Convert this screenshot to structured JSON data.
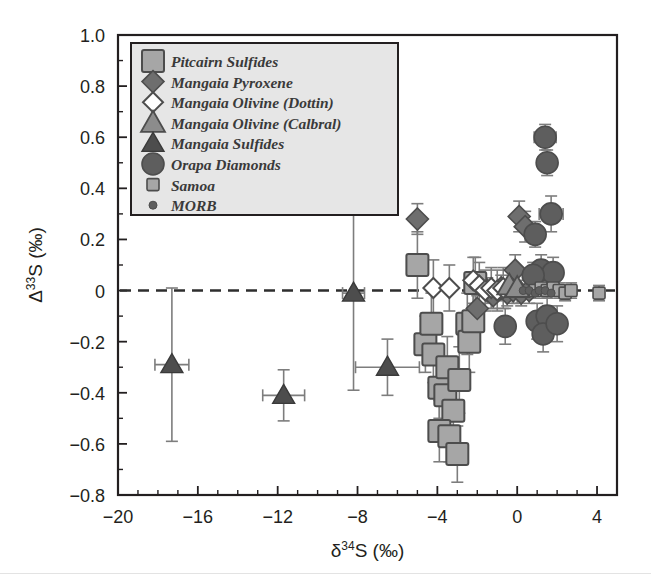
{
  "figure": {
    "background": "#ffffff",
    "axis_color": "#231f20"
  },
  "axes": {
    "x": {
      "label_delta": "δ",
      "label_sup": "34",
      "label_rest": "S (‰)",
      "label_full": "δ34S (‰)",
      "min": -20,
      "max": 5,
      "ticks": [
        -20,
        -16,
        -12,
        -8,
        -4,
        0,
        4
      ],
      "tick_labels": [
        "−20",
        "−16",
        "−12",
        "−8",
        "−4",
        "0",
        "4"
      ],
      "minor_step": 1
    },
    "y": {
      "label_delta": "Δ",
      "label_sup": "33",
      "label_rest": "S (‰)",
      "label_full": "Δ33S (‰)",
      "min": -0.8,
      "max": 1.0,
      "ticks": [
        -0.8,
        -0.6,
        -0.4,
        -0.2,
        0,
        0.2,
        0.4,
        0.6,
        0.8,
        1.0
      ],
      "tick_labels": [
        "−0.8",
        "−0.6",
        "−0.4",
        "−0.2",
        "0",
        "0.2",
        "0.4",
        "0.6",
        "0.8",
        "1.0"
      ],
      "minor_step": 0.1
    },
    "reference_line": {
      "value": 0,
      "style": "dashed"
    }
  },
  "legend": {
    "position": "top-left",
    "background": "#e6e6e6",
    "items": [
      {
        "label": "Pitcairn Sulfides",
        "marker": "square-large",
        "fill": "#a6a6a6",
        "stroke": "#4d4d4d"
      },
      {
        "label": "Mangaia Pyroxene",
        "marker": "diamond-filled",
        "fill": "#6e6e6e",
        "stroke": "#4d4d4d"
      },
      {
        "label": "Mangaia Olivine (Dottin)",
        "marker": "diamond-open",
        "fill": "#ffffff",
        "stroke": "#4d4d4d"
      },
      {
        "label": "Mangaia Olivine (Calbral)",
        "marker": "triangle-gray",
        "fill": "#8c8c8c",
        "stroke": "#4d4d4d"
      },
      {
        "label": "Mangaia Sulfides",
        "marker": "triangle-dark",
        "fill": "#4d4d4d",
        "stroke": "#3a3a3a"
      },
      {
        "label": "Orapa Diamonds",
        "marker": "circle-filled",
        "fill": "#5e5e5e",
        "stroke": "#4d4d4d"
      },
      {
        "label": "Samoa",
        "marker": "square-small",
        "fill": "#a6a6a6",
        "stroke": "#4d4d4d"
      },
      {
        "label": "MORB",
        "marker": "dot-small",
        "fill": "#5e5e5e",
        "stroke": "#4d4d4d"
      }
    ]
  },
  "chart_data": {
    "type": "scatter",
    "title": "",
    "xlabel": "δ34S (‰)",
    "ylabel": "Δ33S (‰)",
    "xlim": [
      -20,
      5
    ],
    "ylim": [
      -0.8,
      1.0
    ],
    "grid": false,
    "legend_position": "top-left",
    "reference_lines": [
      {
        "axis": "y",
        "value": 0,
        "style": "dashed"
      }
    ],
    "series": [
      {
        "name": "Mangaia Sulfides",
        "marker": "triangle-dark",
        "points": [
          {
            "x": -17.3,
            "y": -0.29,
            "xerr": 0.85,
            "yerr": 0.3
          },
          {
            "x": -11.7,
            "y": -0.41,
            "xerr": 1.05,
            "yerr": 0.1
          },
          {
            "x": -8.2,
            "y": -0.01,
            "xerr": 0.55,
            "yerr": 0.38
          },
          {
            "x": -6.5,
            "y": -0.3,
            "xerr": 1.6,
            "yerr": 0.11
          }
        ]
      },
      {
        "name": "Pitcairn Sulfides",
        "marker": "square-large",
        "points": [
          {
            "x": -5.0,
            "y": 0.1,
            "xerr": 0,
            "yerr": 0.13
          },
          {
            "x": -4.6,
            "y": -0.21,
            "xerr": 0,
            "yerr": 0.11
          },
          {
            "x": -4.3,
            "y": -0.13,
            "xerr": 0,
            "yerr": 0.12
          },
          {
            "x": -4.2,
            "y": -0.25,
            "xerr": 0,
            "yerr": 0.11
          },
          {
            "x": -3.9,
            "y": -0.38,
            "xerr": 0,
            "yerr": 0.12
          },
          {
            "x": -3.6,
            "y": -0.41,
            "xerr": 0,
            "yerr": 0.12
          },
          {
            "x": -3.5,
            "y": -0.3,
            "xerr": 0,
            "yerr": 0.12
          },
          {
            "x": -3.2,
            "y": -0.47,
            "xerr": 0,
            "yerr": 0.11
          },
          {
            "x": -2.9,
            "y": -0.35,
            "xerr": 0,
            "yerr": 0.13
          },
          {
            "x": -3.9,
            "y": -0.55,
            "xerr": 0,
            "yerr": 0.12
          },
          {
            "x": -3.4,
            "y": -0.57,
            "xerr": 0,
            "yerr": 0.1
          },
          {
            "x": -3.0,
            "y": -0.64,
            "xerr": 0,
            "yerr": 0.11
          },
          {
            "x": -2.5,
            "y": -0.13,
            "xerr": 0,
            "yerr": 0.12
          },
          {
            "x": -2.4,
            "y": -0.2,
            "xerr": 0,
            "yerr": 0.12
          },
          {
            "x": -2.2,
            "y": -0.12,
            "xerr": 0,
            "yerr": 0.12
          },
          {
            "x": -2.1,
            "y": 0.03,
            "xerr": 0,
            "yerr": 0.1
          }
        ]
      },
      {
        "name": "Mangaia Pyroxene",
        "marker": "diamond-filled",
        "points": [
          {
            "x": -5.0,
            "y": 0.28,
            "xerr": 0,
            "yerr": 0.06
          },
          {
            "x": 0.1,
            "y": 0.29,
            "xerr": 0,
            "yerr": 0.06
          },
          {
            "x": 0.4,
            "y": 0.25,
            "xerr": 0,
            "yerr": 0.06
          },
          {
            "x": -0.1,
            "y": 0.08,
            "xerr": 0,
            "yerr": 0.06
          },
          {
            "x": -1.5,
            "y": 0.0,
            "xerr": 0,
            "yerr": 0.05
          },
          {
            "x": -1.2,
            "y": -0.02,
            "xerr": 0,
            "yerr": 0.05
          },
          {
            "x": -0.8,
            "y": 0.01,
            "xerr": 0,
            "yerr": 0.05
          },
          {
            "x": -0.5,
            "y": -0.01,
            "xerr": 0,
            "yerr": 0.05
          },
          {
            "x": -0.2,
            "y": 0.0,
            "xerr": 0,
            "yerr": 0.05
          },
          {
            "x": 0.2,
            "y": -0.01,
            "xerr": 0,
            "yerr": 0.05
          },
          {
            "x": 0.6,
            "y": 0.0,
            "xerr": 0,
            "yerr": 0.05
          },
          {
            "x": -2.0,
            "y": -0.07,
            "xerr": 0,
            "yerr": 0.05
          }
        ]
      },
      {
        "name": "Mangaia Olivine (Dottin)",
        "marker": "diamond-open",
        "points": [
          {
            "x": -4.2,
            "y": 0.01,
            "xerr": 0,
            "yerr": 0.11
          },
          {
            "x": -3.4,
            "y": 0.01,
            "xerr": 0,
            "yerr": 0.09
          },
          {
            "x": -2.2,
            "y": 0.04,
            "xerr": 0,
            "yerr": 0.09
          },
          {
            "x": -1.9,
            "y": 0.02,
            "xerr": 0,
            "yerr": 0.09
          },
          {
            "x": -1.6,
            "y": 0.0,
            "xerr": 0,
            "yerr": 0.08
          },
          {
            "x": -1.3,
            "y": 0.01,
            "xerr": 0,
            "yerr": 0.08
          },
          {
            "x": -1.0,
            "y": 0.0,
            "xerr": 0,
            "yerr": 0.08
          },
          {
            "x": -0.7,
            "y": 0.01,
            "xerr": 0,
            "yerr": 0.08
          }
        ]
      },
      {
        "name": "Mangaia Olivine (Calbral)",
        "marker": "triangle-gray",
        "points": [
          {
            "x": -0.4,
            "y": 0.02,
            "xerr": 0,
            "yerr": 0.06
          },
          {
            "x": 0.0,
            "y": 0.01,
            "xerr": 0,
            "yerr": 0.06
          }
        ]
      },
      {
        "name": "Orapa Diamonds",
        "marker": "circle-filled",
        "points": [
          {
            "x": 1.4,
            "y": 0.6,
            "xerr": 0.55,
            "yerr": 0.05
          },
          {
            "x": 1.5,
            "y": 0.5,
            "xerr": 0.45,
            "yerr": 0.05
          },
          {
            "x": 1.7,
            "y": 0.3,
            "xerr": 0.6,
            "yerr": 0.07
          },
          {
            "x": 0.9,
            "y": 0.22,
            "xerr": 0.4,
            "yerr": 0.05
          },
          {
            "x": 1.2,
            "y": 0.08,
            "xerr": 0.45,
            "yerr": 0.06
          },
          {
            "x": 1.8,
            "y": 0.07,
            "xerr": 0.4,
            "yerr": 0.06
          },
          {
            "x": 0.8,
            "y": 0.06,
            "xerr": 0.35,
            "yerr": 0.05
          },
          {
            "x": 1.0,
            "y": -0.12,
            "xerr": 0.35,
            "yerr": 0.07
          },
          {
            "x": 1.5,
            "y": -0.1,
            "xerr": 0.35,
            "yerr": 0.07
          },
          {
            "x": 1.3,
            "y": -0.17,
            "xerr": 0.35,
            "yerr": 0.07
          },
          {
            "x": 2.0,
            "y": -0.13,
            "xerr": 0.35,
            "yerr": 0.07
          },
          {
            "x": -0.6,
            "y": -0.14,
            "xerr": 0,
            "yerr": 0.07
          }
        ]
      },
      {
        "name": "Samoa",
        "marker": "square-small",
        "points": [
          {
            "x": 0.9,
            "y": 0.0,
            "xerr": 0,
            "yerr": 0.03
          },
          {
            "x": 1.2,
            "y": 0.01,
            "xerr": 0,
            "yerr": 0.03
          },
          {
            "x": 1.5,
            "y": 0.0,
            "xerr": 0,
            "yerr": 0.03
          },
          {
            "x": 1.8,
            "y": 0.01,
            "xerr": 0,
            "yerr": 0.03
          },
          {
            "x": 2.1,
            "y": 0.0,
            "xerr": 0,
            "yerr": 0.03
          },
          {
            "x": 2.4,
            "y": -0.01,
            "xerr": 0,
            "yerr": 0.03
          },
          {
            "x": 2.7,
            "y": 0.0,
            "xerr": 0,
            "yerr": 0.03
          },
          {
            "x": 4.1,
            "y": -0.01,
            "xerr": 0,
            "yerr": 0.03
          }
        ]
      },
      {
        "name": "MORB",
        "marker": "dot-small",
        "points": [
          {
            "x": 0.3,
            "y": 0.0,
            "xerr": 0,
            "yerr": 0
          },
          {
            "x": 0.6,
            "y": 0.0,
            "xerr": 0,
            "yerr": 0
          },
          {
            "x": 0.9,
            "y": -0.01,
            "xerr": 0,
            "yerr": 0
          },
          {
            "x": 1.1,
            "y": 0.0,
            "xerr": 0,
            "yerr": 0
          },
          {
            "x": 1.4,
            "y": 0.0,
            "xerr": 0,
            "yerr": 0
          },
          {
            "x": 1.7,
            "y": -0.01,
            "xerr": 0,
            "yerr": 0
          }
        ]
      }
    ]
  }
}
